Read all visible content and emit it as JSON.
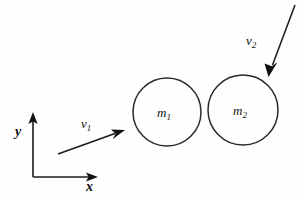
{
  "figure": {
    "background_color": "#fefefe",
    "stroke_color": "#1b1b1b",
    "width": 301,
    "height": 197
  },
  "axes": {
    "origin": {
      "x": 33,
      "y": 177
    },
    "x_axis": {
      "label": "x",
      "label_sub": "",
      "from_x": 33,
      "to_x": 97,
      "y": 177,
      "label_x": 86,
      "label_y": 191
    },
    "y_axis": {
      "label": "y",
      "label_sub": "",
      "x": 33,
      "from_y": 177,
      "to_y": 114,
      "label_x": 15,
      "label_y": 136
    }
  },
  "bodies": [
    {
      "name": "mass-one",
      "label": "m",
      "label_sub": "1",
      "cx": 167,
      "cy": 112,
      "r": 34,
      "label_x": 158,
      "label_y": 117
    },
    {
      "name": "mass-two",
      "label": "m",
      "label_sub": "2",
      "cx": 243,
      "cy": 110,
      "r": 35,
      "label_x": 234,
      "label_y": 115
    }
  ],
  "vectors": [
    {
      "name": "velocity-one",
      "label": "v",
      "label_sub": "1",
      "x1": 58,
      "y1": 154,
      "x2": 124,
      "y2": 130,
      "label_x": 81,
      "label_y": 128,
      "direction": "up-right"
    },
    {
      "name": "velocity-two",
      "label": "v",
      "label_sub": "2",
      "x1": 295,
      "y1": 5,
      "x2": 269,
      "y2": 76,
      "label_x": 246,
      "label_y": 45,
      "direction": "down-left"
    }
  ]
}
